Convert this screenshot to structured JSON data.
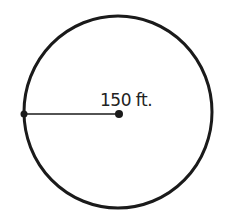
{
  "diagram": {
    "shape": "circle",
    "radius_label": "150 ft.",
    "colors": {
      "stroke": "#1a1a1a",
      "background": "#ffffff",
      "text": "#222222"
    }
  }
}
